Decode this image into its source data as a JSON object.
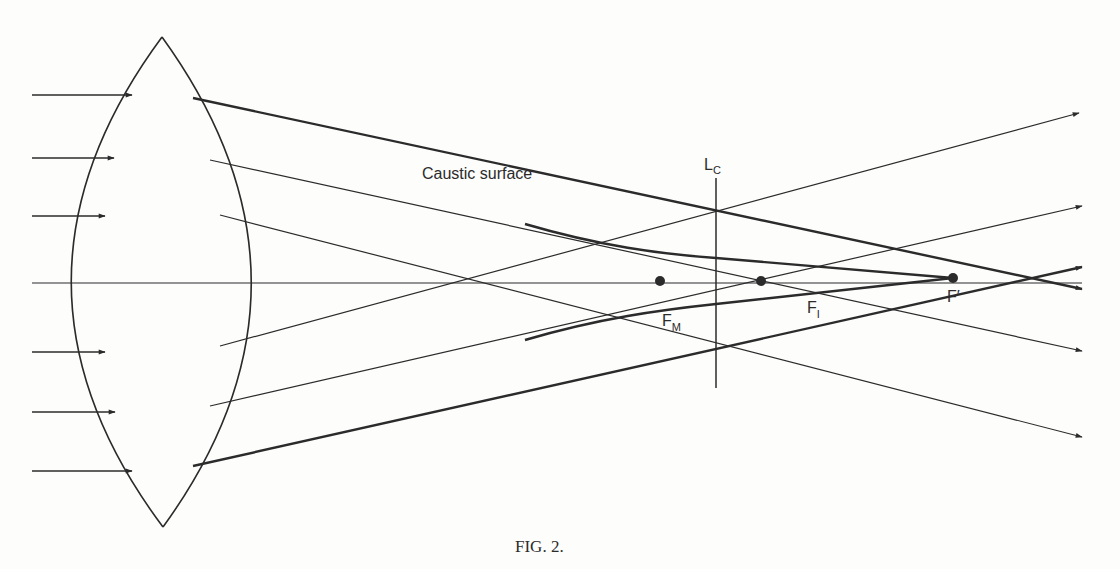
{
  "figure": {
    "caption": "FIG. 2.",
    "stroke_color": "#2b2b2b",
    "background": "#fdfdfc"
  },
  "labels": {
    "caustic": "Caustic surface",
    "lc_main": "L",
    "lc_sub": "C",
    "fm_main": "F",
    "fm_sub": "M",
    "fi_main": "F",
    "fi_sub": "I",
    "fprime": "F′"
  },
  "geometry": {
    "axis": {
      "x1": 32,
      "x2": 1082,
      "y": 283
    },
    "lens": {
      "top": [
        162,
        37
      ],
      "bottom": [
        163,
        527
      ],
      "left_x": 101,
      "right_x": 221
    },
    "incident_rays": [
      {
        "y": 95,
        "x1": 32,
        "x2": 132
      },
      {
        "y": 158,
        "x1": 32,
        "x2": 114
      },
      {
        "y": 216,
        "x1": 32,
        "x2": 105
      },
      {
        "y": 352,
        "x1": 32,
        "x2": 105
      },
      {
        "y": 412,
        "x1": 32,
        "x2": 115
      },
      {
        "y": 471,
        "x1": 32,
        "x2": 132
      }
    ],
    "refracted_rays": [
      {
        "from": [
          193,
          98
        ],
        "through": [
          953,
          278
        ],
        "to": [
          1082,
          289
        ],
        "heavy": true
      },
      {
        "from": [
          210,
          160
        ],
        "through": [
          761,
          281
        ],
        "to": [
          1082,
          351
        ],
        "heavy": false
      },
      {
        "from": [
          220,
          215
        ],
        "through": [
          660,
          281
        ],
        "to": [
          1082,
          437
        ],
        "heavy": false
      },
      {
        "from": [
          220,
          346
        ],
        "through": [
          660,
          281
        ],
        "to": [
          1079,
          113
        ],
        "heavy": false
      },
      {
        "from": [
          210,
          406
        ],
        "through": [
          761,
          281
        ],
        "to": [
          1082,
          206
        ],
        "heavy": false
      },
      {
        "from": [
          193,
          466
        ],
        "through": [
          953,
          278
        ],
        "to": [
          1082,
          267
        ],
        "heavy": true
      }
    ],
    "lc_line": {
      "x": 716,
      "y1": 178,
      "y2": 388
    },
    "focal_points": [
      {
        "name": "FM",
        "x": 660,
        "y": 281
      },
      {
        "name": "FI",
        "x": 761,
        "y": 281
      },
      {
        "name": "Fprime",
        "x": 953,
        "y": 278
      }
    ]
  }
}
